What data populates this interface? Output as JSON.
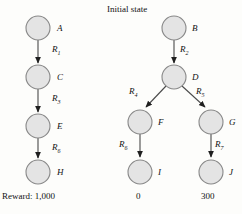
{
  "figure": {
    "title": "Initial state",
    "background_color": "#fdfdfb",
    "node_fill": "#e2e2e2",
    "node_stroke": "#7a7a7a",
    "edge_color": "#2b2b2b"
  },
  "left_chain": {
    "reward_label": "Reward: 1,000",
    "nodes": [
      {
        "id": "A",
        "label": "A",
        "cx": 38,
        "cy": 28,
        "r": 12
      },
      {
        "id": "C",
        "label": "C",
        "cx": 38,
        "cy": 77,
        "r": 12
      },
      {
        "id": "E",
        "label": "E",
        "cx": 38,
        "cy": 126,
        "r": 12
      },
      {
        "id": "H",
        "label": "H",
        "cx": 38,
        "cy": 172,
        "r": 12
      }
    ],
    "edges": [
      {
        "id": "A-C",
        "label_main": "R",
        "label_sub": "1",
        "lx": 52,
        "ly": 48
      },
      {
        "id": "C-E",
        "label_main": "R",
        "label_sub": "3",
        "lx": 52,
        "ly": 97
      },
      {
        "id": "E-H",
        "label_main": "R",
        "label_sub": "6",
        "lx": 52,
        "ly": 146
      }
    ]
  },
  "right_tree": {
    "nodes": [
      {
        "id": "B",
        "label": "B",
        "cx": 174,
        "cy": 28,
        "r": 12,
        "value": null
      },
      {
        "id": "D",
        "label": "D",
        "cx": 174,
        "cy": 77,
        "r": 12,
        "value": null
      },
      {
        "id": "F",
        "label": "F",
        "cx": 140,
        "cy": 122,
        "r": 12,
        "value": null
      },
      {
        "id": "G",
        "label": "G",
        "cx": 211,
        "cy": 122,
        "r": 12,
        "value": null
      },
      {
        "id": "I",
        "label": "I",
        "cx": 140,
        "cy": 172,
        "r": 12,
        "value": "0"
      },
      {
        "id": "J",
        "label": "J",
        "cx": 211,
        "cy": 172,
        "r": 12,
        "value": "300"
      }
    ],
    "edges": [
      {
        "id": "B-D",
        "label_main": "R",
        "label_sub": "2",
        "lx": 188,
        "ly": 48
      },
      {
        "id": "D-F",
        "label_main": "R",
        "label_sub": "4",
        "lx": 134,
        "ly": 93
      },
      {
        "id": "D-G",
        "label_main": "R",
        "label_sub": "5",
        "lx": 199,
        "ly": 93
      },
      {
        "id": "F-I",
        "label_main": "R",
        "label_sub": "6",
        "lx": 121,
        "ly": 145
      },
      {
        "id": "G-J",
        "label_main": "R",
        "label_sub": "7",
        "lx": 220,
        "ly": 145
      }
    ]
  }
}
